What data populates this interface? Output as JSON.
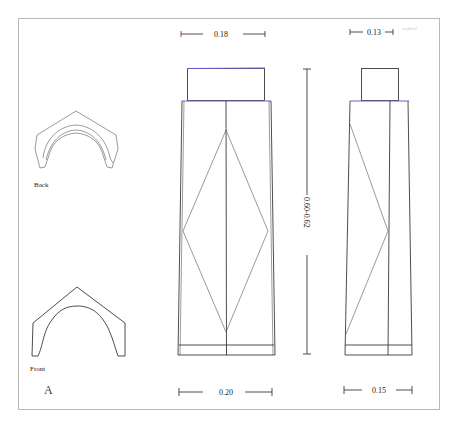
{
  "figure": {
    "panel_label": "A",
    "views": {
      "back_label": "Back",
      "front_label": "Front"
    },
    "dimensions": {
      "front_top_width": "0.18",
      "front_bottom_width": "0.20",
      "side_top_width": "0.13",
      "side_bottom_width": "0.15",
      "height": "0.60-0.62"
    },
    "corner_annotation": "scale/ref"
  },
  "colors": {
    "line": "#3a3a3a",
    "accent": "#6b5fd0",
    "dimension_accent": "#a0306a",
    "frame": "#b8b8b8"
  }
}
